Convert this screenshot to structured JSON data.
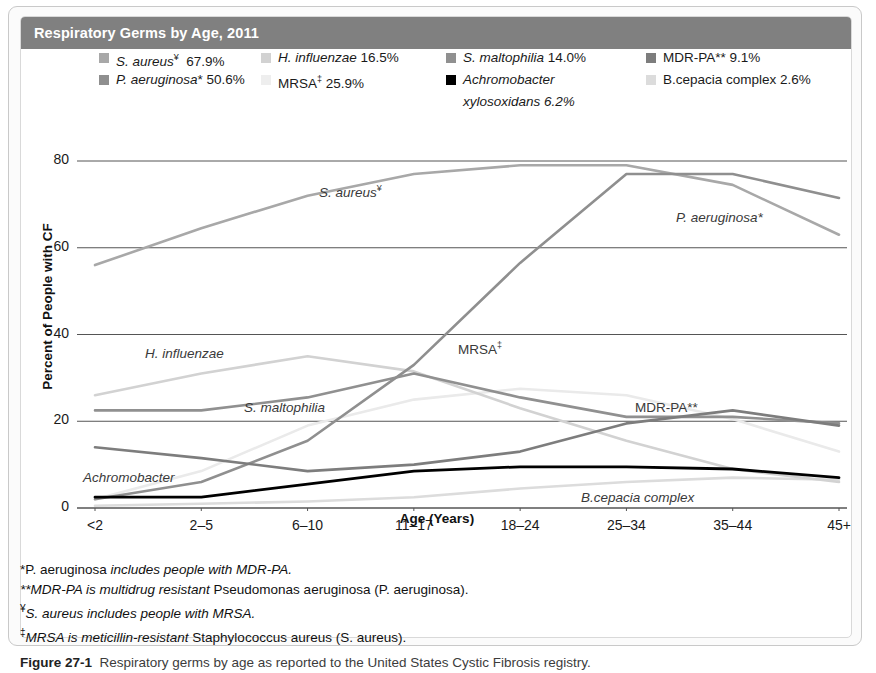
{
  "header": {
    "title": "Respiratory Germs by Age, 2011",
    "bar_color": "#808080"
  },
  "legend": {
    "columns": [
      {
        "items": [
          {
            "label": "S. aureus",
            "sup": "¥",
            "value": "67.9%",
            "color": "#a8a8a8",
            "italic": true
          },
          {
            "label": "P. aeruginosa*",
            "sup": "",
            "value": "50.6%",
            "color": "#8f8f8f",
            "italic": true
          }
        ]
      },
      {
        "items": [
          {
            "label": "H. influenzae",
            "sup": "",
            "value": "16.5%",
            "color": "#d2d2d2",
            "italic": true
          },
          {
            "label": "MRSA",
            "sup": "‡",
            "value": "25.9%",
            "color": "#eaeaea",
            "italic": false
          }
        ]
      },
      {
        "items": [
          {
            "label": "S. maltophilia",
            "sup": "",
            "value": "14.0%",
            "color": "#909090",
            "italic": true
          },
          {
            "label": "Achromobacter",
            "sup": "",
            "value": "",
            "color": "#000000",
            "italic": true,
            "sub": "xylosoxidans  6.2%"
          }
        ]
      },
      {
        "items": [
          {
            "label": "MDR-PA**",
            "sup": "",
            "value": "9.1%",
            "color": "#7d7d7d",
            "italic": false
          },
          {
            "label": "B.cepacia complex",
            "sup": "",
            "value": "2.6%",
            "color": "#dcdcdc",
            "italic": false
          }
        ]
      }
    ]
  },
  "chart_data": {
    "type": "line",
    "title": "Respiratory Germs by Age, 2011",
    "xlabel": "Age (Years)",
    "ylabel": "Percent of People with CF",
    "categories": [
      "<2",
      "2–5",
      "6–10",
      "11–17",
      "18–24",
      "25–34",
      "35–44",
      "45+"
    ],
    "ylim": [
      0,
      80
    ],
    "yticks": [
      0,
      20,
      40,
      60,
      80
    ],
    "grid": "horizontal",
    "legend_position": "top",
    "series": [
      {
        "name": "S. aureus",
        "legend_value": "67.9%",
        "color": "#a8a8a8",
        "width": 2.6,
        "values": [
          56.0,
          64.5,
          72.0,
          77.0,
          79.0,
          79.0,
          74.5,
          63.0
        ]
      },
      {
        "name": "P. aeruginosa",
        "legend_value": "50.6%",
        "color": "#8f8f8f",
        "width": 2.6,
        "values": [
          2.0,
          6.0,
          15.5,
          33.0,
          56.5,
          77.0,
          77.0,
          71.5
        ]
      },
      {
        "name": "H. influenzae",
        "legend_value": "16.5%",
        "color": "#d2d2d2",
        "width": 2.6,
        "values": [
          26.0,
          31.0,
          35.0,
          31.5,
          23.0,
          15.5,
          9.0,
          6.0
        ]
      },
      {
        "name": "MRSA",
        "legend_value": "25.9%",
        "color": "#eaeaea",
        "width": 2.6,
        "values": [
          2.0,
          8.5,
          19.0,
          25.0,
          27.5,
          26.0,
          20.5,
          13.0
        ]
      },
      {
        "name": "S. maltophilia",
        "legend_value": "14.0%",
        "color": "#909090",
        "width": 2.6,
        "values": [
          22.5,
          22.5,
          25.5,
          31.0,
          25.5,
          21.0,
          21.0,
          19.5
        ]
      },
      {
        "name": "MDR-PA",
        "legend_value": "9.1%",
        "color": "#7d7d7d",
        "width": 2.6,
        "values": [
          14.0,
          11.5,
          8.5,
          10.0,
          13.0,
          19.5,
          22.5,
          19.0
        ]
      },
      {
        "name": "Achromobacter xylosoxidans",
        "legend_value": "6.2%",
        "color": "#000000",
        "width": 2.8,
        "values": [
          2.5,
          2.5,
          5.5,
          8.5,
          9.5,
          9.5,
          9.0,
          7.0
        ]
      },
      {
        "name": "B.cepacia complex",
        "legend_value": "2.6%",
        "color": "#dcdcdc",
        "width": 2.6,
        "values": [
          0.5,
          1.0,
          1.5,
          2.5,
          4.5,
          6.0,
          7.0,
          6.5
        ]
      }
    ],
    "inline_labels": [
      {
        "text": "S. aureus",
        "sup": "¥",
        "italic": true,
        "x": 298,
        "y": 166
      },
      {
        "text": "P. aeruginosa*",
        "sup": "",
        "italic": true,
        "x": 655,
        "y": 193
      },
      {
        "text": "H. influenzae",
        "sup": "",
        "italic": true,
        "x": 124,
        "y": 329
      },
      {
        "text": "MRSA",
        "sup": "‡",
        "italic": false,
        "x": 437,
        "y": 323
      },
      {
        "text": "S. maltophilia",
        "sup": "",
        "italic": true,
        "x": 223,
        "y": 383
      },
      {
        "text": "MDR-PA**",
        "sup": "",
        "italic": false,
        "x": 614,
        "y": 383
      },
      {
        "text": "Achromobacter",
        "sup": "",
        "italic": true,
        "x": 62,
        "y": 453
      },
      {
        "text": "B.cepacia complex",
        "sup": "",
        "italic": true,
        "x": 560,
        "y": 473
      }
    ]
  },
  "footnotes": [
    {
      "marker": "*",
      "plain1": "P. aeruginosa ",
      "em": "includes people with MDR-PA.",
      "plain2": ""
    },
    {
      "marker": "**",
      "plain1": "",
      "em": "MDR-PA is multidrug resistant ",
      "plain2": "Pseudomonas aeruginosa (P. aeruginosa)."
    },
    {
      "marker": "¥",
      "plain1": "",
      "em": "S. aureus includes people with MRSA.",
      "plain2": ""
    },
    {
      "marker": "‡",
      "plain1": "",
      "em": "MRSA is meticillin-resistant ",
      "plain2": "Staphylococcus aureus (S. aureus)."
    }
  ],
  "caption": {
    "label": "Figure 27-1",
    "text": "Respiratory germs by age as reported to the United States Cystic Fibrosis registry."
  }
}
